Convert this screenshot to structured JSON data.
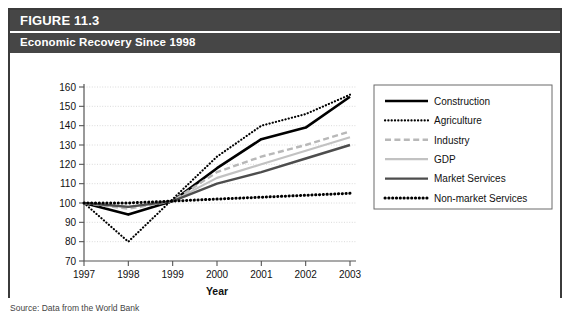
{
  "figure": {
    "label": "FIGURE 11.3",
    "subtitle": "Economic Recovery Since 1998",
    "source_note": "Source: Data from the World Bank"
  },
  "colors": {
    "header_band": "#464646",
    "box_border": "#3b3b3b",
    "grid": "#d6d6d6",
    "axis": "#555555",
    "construction": "#000000",
    "agriculture": "#000000",
    "industry": "#b8b8b8",
    "gdp": "#c2c2c2",
    "market_services": "#4d4d4d",
    "non_market_services": "#000000"
  },
  "chart_data": {
    "type": "line",
    "title": "Economic Recovery Since 1998",
    "xlabel": "Year",
    "ylabel": "",
    "categories": [
      "1997",
      "1998",
      "1999",
      "2000",
      "2001",
      "2002",
      "2003"
    ],
    "x": [
      1997,
      1998,
      1999,
      2000,
      2001,
      2002,
      2003
    ],
    "xlim": [
      1997,
      2003
    ],
    "ylim": [
      70,
      160
    ],
    "yticks": [
      70,
      80,
      90,
      100,
      110,
      120,
      130,
      140,
      150,
      160
    ],
    "grid": true,
    "legend_position": "right",
    "series": [
      {
        "name": "Construction",
        "style": "solid-thick-black",
        "values": [
          100,
          94,
          101,
          118,
          133,
          139,
          155
        ]
      },
      {
        "name": "Agriculture",
        "style": "fine-dotted-black",
        "values": [
          100,
          80,
          102,
          124,
          140,
          146,
          156
        ]
      },
      {
        "name": "Industry",
        "style": "dashed-gray",
        "values": [
          100,
          97,
          101,
          116,
          124,
          130,
          137
        ]
      },
      {
        "name": "GDP",
        "style": "solid-light-gray",
        "values": [
          100,
          98,
          101,
          113,
          120,
          127,
          134
        ]
      },
      {
        "name": "Market Services",
        "style": "solid-dark-gray",
        "values": [
          100,
          98,
          101,
          110,
          116,
          123,
          130
        ]
      },
      {
        "name": "Non-market Services",
        "style": "bold-dotted-black",
        "values": [
          100,
          100,
          101,
          102,
          103,
          104,
          105
        ]
      }
    ]
  }
}
